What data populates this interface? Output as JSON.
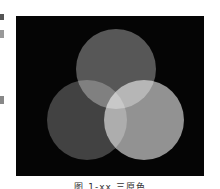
{
  "figure": {
    "background_color": "#050505",
    "circles": [
      {
        "name": "top",
        "cx": 100,
        "cy": 53,
        "r": 40,
        "color": "#545454"
      },
      {
        "name": "bottom-left",
        "cx": 71,
        "cy": 104,
        "r": 40,
        "color": "#3e3e3e"
      },
      {
        "name": "bottom-right",
        "cx": 128,
        "cy": 104,
        "r": 40,
        "color": "#909090"
      }
    ],
    "blend": "screen"
  },
  "caption": {
    "text": "图 1-xx 三原色"
  }
}
